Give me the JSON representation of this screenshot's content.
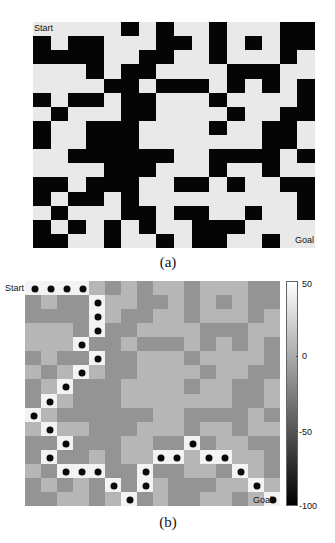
{
  "panel_a": {
    "caption": "(a)",
    "start_label": "Start",
    "goal_label": "Goal",
    "rows": 16,
    "cols": 16,
    "colors": {
      "free": "#e9e9e9",
      "wall": "#050505"
    }
  },
  "panel_b": {
    "caption": "(b)",
    "start_label": "Start",
    "goal_label": "Goal",
    "colors": {
      "free": "#b6b6b6",
      "wall": "#949494",
      "path": "#f3f3f3",
      "dot": "#0a0a0a"
    },
    "colorbar": {
      "ticks": [
        "50",
        "0",
        "-50",
        "-100"
      ],
      "min": -100,
      "max": 50
    }
  },
  "chart_data": [
    {
      "type": "heatmap",
      "title": "(a) Binary maze grid",
      "rows": 16,
      "cols": 16,
      "legend": "black = obstacle, white = free",
      "annotations": [
        "Start (top-left)",
        "Goal (bottom-right)"
      ],
      "obstacles_by_row": [
        [
          5,
          7,
          10,
          14,
          15
        ],
        [
          0,
          2,
          3,
          7,
          8,
          10,
          12,
          14,
          15
        ],
        [
          0,
          1,
          2,
          3,
          6,
          7,
          10,
          14
        ],
        [
          3,
          5,
          6,
          11,
          12,
          13
        ],
        [
          4,
          5,
          7,
          8,
          9,
          11,
          13,
          15
        ],
        [
          0,
          2,
          3,
          5,
          6,
          10,
          15
        ],
        [
          1,
          5,
          6,
          11,
          14,
          15
        ],
        [
          0,
          3,
          4,
          5,
          10,
          13,
          14
        ],
        [
          0,
          3,
          4,
          5,
          13,
          14
        ],
        [
          2,
          3,
          4,
          5,
          6,
          7,
          10,
          11,
          12,
          13,
          15
        ],
        [
          4,
          5,
          6,
          10,
          13
        ],
        [
          0,
          1,
          3,
          4,
          5,
          8,
          9,
          11,
          14,
          15
        ],
        [
          0,
          2,
          3,
          5,
          15
        ],
        [
          1,
          5,
          6,
          8,
          9,
          12,
          15
        ],
        [
          0,
          2,
          4,
          6,
          9,
          10,
          11
        ],
        [
          0,
          1,
          4,
          7,
          9,
          10,
          13
        ]
      ]
    },
    {
      "type": "heatmap",
      "title": "(b) Value map with planned path",
      "rows": 16,
      "cols": 16,
      "colorbar": {
        "range": [
          -100,
          50
        ],
        "ticks": [
          50,
          0,
          -50,
          -100
        ]
      },
      "cell_values": {
        "free": 0,
        "obstacle": -20,
        "path": 50
      },
      "annotations": [
        "Start (top-left)",
        "Goal (bottom-right)"
      ],
      "path": [
        [
          0,
          0
        ],
        [
          0,
          1
        ],
        [
          0,
          2
        ],
        [
          0,
          3
        ],
        [
          1,
          4
        ],
        [
          2,
          4
        ],
        [
          3,
          4
        ],
        [
          4,
          3
        ],
        [
          5,
          4
        ],
        [
          6,
          3
        ],
        [
          7,
          2
        ],
        [
          8,
          1
        ],
        [
          9,
          0
        ],
        [
          10,
          1
        ],
        [
          11,
          2
        ],
        [
          12,
          1
        ],
        [
          13,
          2
        ],
        [
          13,
          3
        ],
        [
          13,
          4
        ],
        [
          14,
          5
        ],
        [
          15,
          6
        ],
        [
          14,
          7
        ],
        [
          13,
          7
        ],
        [
          12,
          8
        ],
        [
          12,
          9
        ],
        [
          11,
          10
        ],
        [
          12,
          11
        ],
        [
          12,
          12
        ],
        [
          13,
          13
        ],
        [
          14,
          14
        ],
        [
          15,
          15
        ]
      ]
    }
  ]
}
